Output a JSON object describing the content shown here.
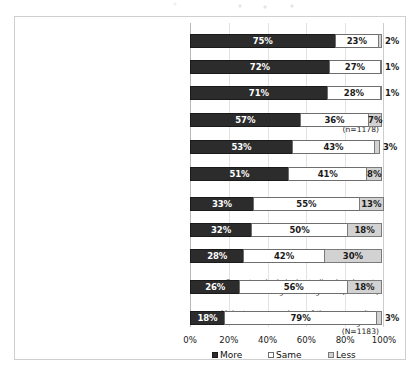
{
  "chart_data": {
    "type": "bar",
    "orientation": "horizontal",
    "stacked": true,
    "title": "",
    "subtitle": "",
    "xlabel": "",
    "ylabel": "",
    "xlim": [
      0,
      100
    ],
    "xticks": [
      "0%",
      "20%",
      "40%",
      "60%",
      "80%",
      "100%"
    ],
    "xtick_values": [
      0,
      20,
      40,
      60,
      80,
      100
    ],
    "grid": true,
    "legend_position": "bottom",
    "legend": [
      "More",
      "Same",
      "Less"
    ],
    "categories": [
      "People with a mental illness (1190)",
      "The elderly (n=1208)",
      "Disabled people (n=1202)",
      "Indigenous people in remote areas (n=1178)",
      "Australians living in remote areas (n=1177)",
      "Children (n=1192)",
      "Indigenous people in urban areas (n=1161)",
      "Gay and lesbian people (n=1173)",
      "Asylum seekers (n=1149)",
      "Recent arrivals in Australia - immigrants and refugees living here (N=1170)",
      "Mainstream members of the community - don t fall into ANY other categories (N=1183)"
    ],
    "series": [
      {
        "name": "More",
        "values": [
          75,
          72,
          71,
          57,
          53,
          51,
          33,
          32,
          28,
          26,
          18
        ]
      },
      {
        "name": "Same",
        "values": [
          23,
          27,
          28,
          36,
          43,
          41,
          55,
          50,
          42,
          56,
          79
        ]
      },
      {
        "name": "Less",
        "values": [
          2,
          1,
          1,
          7,
          3,
          8,
          13,
          18,
          30,
          18,
          3
        ]
      }
    ],
    "data_labels": {
      "More": [
        "75%",
        "72%",
        "71%",
        "57%",
        "53%",
        "51%",
        "33%",
        "32%",
        "28%",
        "26%",
        "18%"
      ],
      "Same": [
        "23%",
        "27%",
        "28%",
        "36%",
        "43%",
        "41%",
        "55%",
        "50%",
        "42%",
        "56%",
        "79%"
      ],
      "Less": [
        "2%",
        "1%",
        "1%",
        "7%",
        "3%",
        "8%",
        "13%",
        "18%",
        "30%",
        "18%",
        "3%"
      ]
    },
    "less_label_outside": [
      true,
      true,
      true,
      false,
      true,
      false,
      false,
      false,
      false,
      false,
      true
    ],
    "colors": {
      "more": "#2c2c2c",
      "same": "#ffffff",
      "less": "#d2d2d2",
      "border": "#6e6e6e",
      "grid": "#e3e3e3",
      "text": "#1d1d1d",
      "frame": "#cfcfcf"
    }
  }
}
